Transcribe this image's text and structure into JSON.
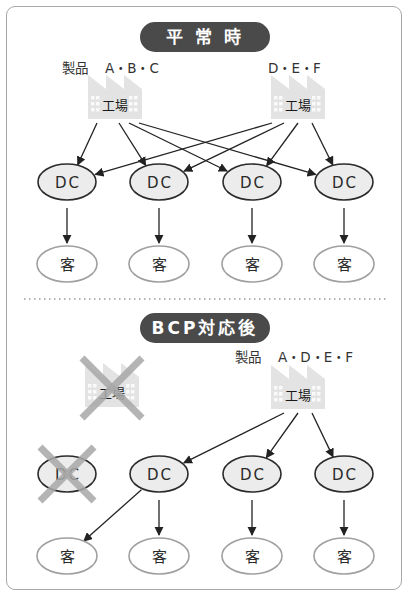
{
  "colors": {
    "pill_bg": "#4a4a4a",
    "pill_text": "#ffffff",
    "dc_fill": "#ececec",
    "dc_stroke": "#2b2b2b",
    "customer_stroke": "#a0a0a0",
    "factory_fill": "#e3e3e3",
    "arrow": "#222222",
    "cross": "#a8a8a8",
    "divider": "#9a9a9a",
    "frame": "#a8a8a8"
  },
  "normal": {
    "title": "平 常 時",
    "factories": [
      {
        "id": "f1",
        "label": "工場",
        "product_prefix": "製品",
        "products": "A・B・C",
        "disabled": false
      },
      {
        "id": "f2",
        "label": "工場",
        "product_prefix": "",
        "products": "D・E・F",
        "disabled": false
      }
    ],
    "dcs": [
      {
        "id": "dc1",
        "label": "DC",
        "disabled": false
      },
      {
        "id": "dc2",
        "label": "DC",
        "disabled": false
      },
      {
        "id": "dc3",
        "label": "DC",
        "disabled": false
      },
      {
        "id": "dc4",
        "label": "DC",
        "disabled": false
      }
    ],
    "customers": [
      {
        "id": "c1",
        "label": "客"
      },
      {
        "id": "c2",
        "label": "客"
      },
      {
        "id": "c3",
        "label": "客"
      },
      {
        "id": "c4",
        "label": "客"
      }
    ],
    "edges": [
      {
        "from": "f1",
        "to": "dc1"
      },
      {
        "from": "f1",
        "to": "dc2"
      },
      {
        "from": "f1",
        "to": "dc3"
      },
      {
        "from": "f1",
        "to": "dc4"
      },
      {
        "from": "f2",
        "to": "dc1"
      },
      {
        "from": "f2",
        "to": "dc2"
      },
      {
        "from": "f2",
        "to": "dc3"
      },
      {
        "from": "f2",
        "to": "dc4"
      },
      {
        "from": "dc1",
        "to": "c1"
      },
      {
        "from": "dc2",
        "to": "c2"
      },
      {
        "from": "dc3",
        "to": "c3"
      },
      {
        "from": "dc4",
        "to": "c4"
      }
    ]
  },
  "bcp": {
    "title": "BCP対応後",
    "factories": [
      {
        "id": "f1",
        "label": "工場",
        "product_prefix": "",
        "products": "",
        "disabled": true
      },
      {
        "id": "f2",
        "label": "工場",
        "product_prefix": "製品",
        "products": "A・D・E・F",
        "disabled": false
      }
    ],
    "dcs": [
      {
        "id": "dc1",
        "label": "DC",
        "disabled": true
      },
      {
        "id": "dc2",
        "label": "DC",
        "disabled": false
      },
      {
        "id": "dc3",
        "label": "DC",
        "disabled": false
      },
      {
        "id": "dc4",
        "label": "DC",
        "disabled": false
      }
    ],
    "customers": [
      {
        "id": "c1",
        "label": "客"
      },
      {
        "id": "c2",
        "label": "客"
      },
      {
        "id": "c3",
        "label": "客"
      },
      {
        "id": "c4",
        "label": "客"
      }
    ],
    "edges": [
      {
        "from": "f2",
        "to": "dc2"
      },
      {
        "from": "f2",
        "to": "dc3"
      },
      {
        "from": "f2",
        "to": "dc4"
      },
      {
        "from": "dc2",
        "to": "c1"
      },
      {
        "from": "dc2",
        "to": "c2"
      },
      {
        "from": "dc3",
        "to": "c3"
      },
      {
        "from": "dc4",
        "to": "c4"
      }
    ]
  }
}
